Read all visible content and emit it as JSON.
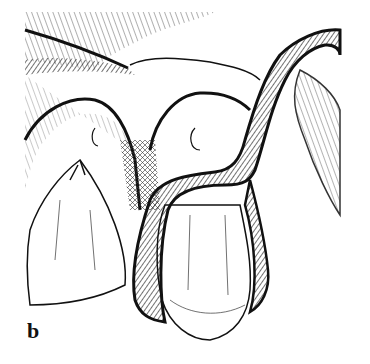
{
  "figure": {
    "panel_label": "b",
    "colors": {
      "ink": "#111111",
      "paper": "#ffffff"
    }
  }
}
